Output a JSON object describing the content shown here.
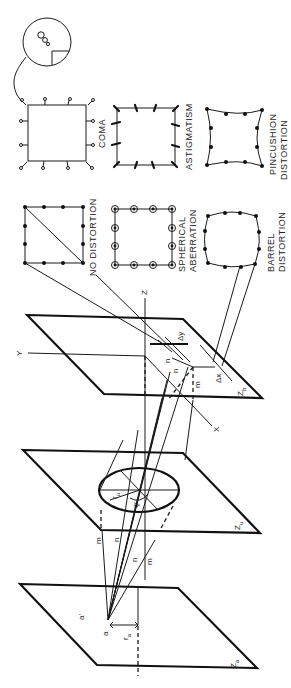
{
  "figure": {
    "planes": [
      {
        "name": "object-plane",
        "label": "Z",
        "subscript": "a"
      },
      {
        "name": "lens-plane",
        "label": "Z",
        "subscript": "u"
      },
      {
        "name": "image-plane",
        "label": "Z",
        "subscript": "b"
      }
    ],
    "axes": {
      "x": "X",
      "y": "Y",
      "z": "Z"
    },
    "deltas": {
      "dx": "Δx",
      "dy": "Δy"
    },
    "object_labels": {
      "a": "a",
      "a_prime": "a'",
      "r": "r",
      "r_sub": "a"
    },
    "ray_labels": {
      "m": "m",
      "n": "n"
    },
    "lens_labels": {
      "r": "r",
      "r_sub": "u",
      "psi": "ψ"
    },
    "patterns": [
      {
        "id": "no-distortion",
        "lines": [
          "NO DISTORTION"
        ]
      },
      {
        "id": "spherical-aberration",
        "lines": [
          "SPHERICAL",
          "ABERRATION"
        ]
      },
      {
        "id": "barrel-distortion",
        "lines": [
          "BARREL",
          "DISTORTION"
        ]
      },
      {
        "id": "coma",
        "lines": [
          "COMA"
        ]
      },
      {
        "id": "astigmatism",
        "lines": [
          "ASTIGMATISM"
        ]
      },
      {
        "id": "pincushion-distortion",
        "lines": [
          "PINCUSHION",
          "DISTORTION"
        ]
      }
    ]
  }
}
